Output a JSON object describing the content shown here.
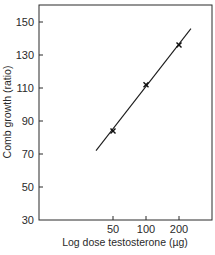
{
  "chart_data": {
    "type": "line",
    "title": "",
    "xlabel": "Log dose testosterone (µg)",
    "ylabel": "Comb growth (ratio)",
    "x_scale": "log",
    "x_ticks": [
      50,
      100,
      200
    ],
    "x_tick_labels": [
      "50",
      "100",
      "200"
    ],
    "y_ticks": [
      30,
      50,
      70,
      90,
      110,
      130,
      150
    ],
    "y_tick_labels": [
      "30",
      "50",
      "70",
      "90",
      "110",
      "130",
      "150"
    ],
    "ylim": [
      30,
      160
    ],
    "grid": false,
    "legend": null,
    "series": [
      {
        "name": "Measured points",
        "marker": "x",
        "x": [
          50,
          100,
          200
        ],
        "y": [
          84,
          112,
          136
        ]
      },
      {
        "name": "Fitted line",
        "style": "line",
        "x": [
          35,
          257
        ],
        "y": [
          72,
          146
        ]
      }
    ]
  }
}
